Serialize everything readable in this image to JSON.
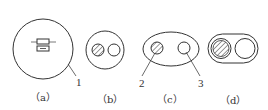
{
  "figure": {
    "stroke_color": "#333333",
    "background": "#ffffff",
    "panels": [
      {
        "id": "a",
        "label": "（a）",
        "shape": "large circle with fuse-like rectangles in center"
      },
      {
        "id": "b",
        "label": "（b）",
        "shape": "circle containing one hatched and one plain small circle"
      },
      {
        "id": "c",
        "label": "（c）",
        "shape": "ellipse containing one hatched and one plain small circle"
      },
      {
        "id": "d",
        "label": "（d）",
        "shape": "stadium (rounded rectangle) containing one hatched and one plain circle"
      }
    ],
    "callouts": [
      {
        "number": "1",
        "points_to": "outer circle of (a)"
      },
      {
        "number": "2",
        "points_to": "hatched circle of (c)"
      },
      {
        "number": "3",
        "points_to": "plain circle of (c)"
      }
    ]
  }
}
